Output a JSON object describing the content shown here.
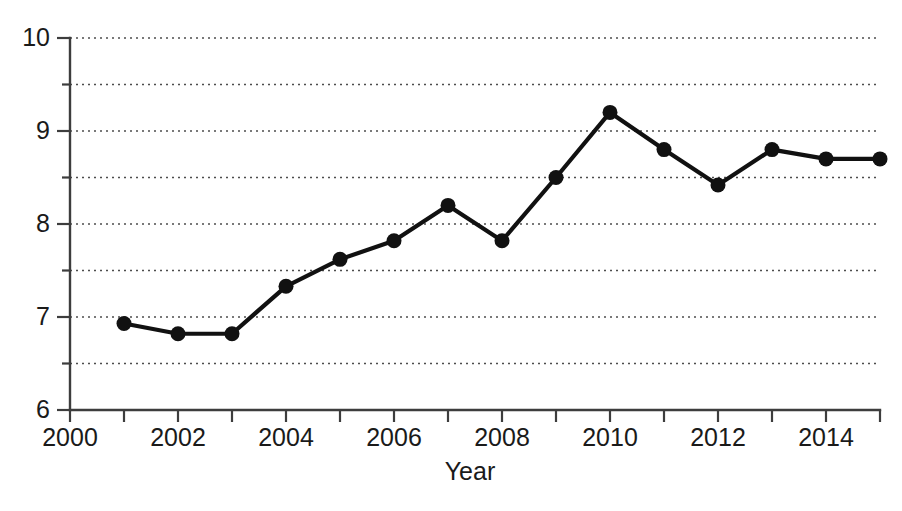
{
  "chart_data": {
    "type": "line",
    "title": "",
    "subtitle": "",
    "xlabel": "Year",
    "ylabel": "",
    "x": [
      2001,
      2002,
      2003,
      2004,
      2005,
      2006,
      2007,
      2008,
      2009,
      2010,
      2011,
      2012,
      2013,
      2014,
      2015
    ],
    "values": [
      6.93,
      6.82,
      6.82,
      7.33,
      7.62,
      7.82,
      8.2,
      7.82,
      8.5,
      9.2,
      8.8,
      8.42,
      8.8,
      8.7,
      8.7
    ],
    "series": [
      {
        "name": "",
        "values": [
          6.93,
          6.82,
          6.82,
          7.33,
          7.62,
          7.82,
          8.2,
          7.82,
          8.5,
          9.2,
          8.8,
          8.42,
          8.8,
          8.7,
          8.7
        ]
      }
    ],
    "xlim": [
      2000,
      2015
    ],
    "ylim": [
      6,
      10
    ],
    "x_tick_values": [
      2000,
      2001,
      2002,
      2003,
      2004,
      2005,
      2006,
      2007,
      2008,
      2009,
      2010,
      2011,
      2012,
      2013,
      2014,
      2015
    ],
    "x_tick_labels": [
      "2000",
      "",
      "2002",
      "",
      "2004",
      "",
      "2006",
      "",
      "2008",
      "",
      "2010",
      "",
      "2012",
      "",
      "2014",
      ""
    ],
    "y_tick_values": [
      6,
      6.5,
      7,
      7.5,
      8,
      8.5,
      9,
      9.5,
      10
    ],
    "y_tick_labels": [
      "6",
      "",
      "7",
      "",
      "8",
      "",
      "9",
      "",
      "10"
    ],
    "grid": true,
    "grid_axis": "y",
    "grid_style": "dotted",
    "legend": "none",
    "legend_position": "none",
    "marker": "circle",
    "line_color": "#111111",
    "marker_color": "#111111",
    "grid_color": "#4d4d4d",
    "axis_color": "#3d3d3d",
    "background_color": "#ffffff",
    "annotations": []
  },
  "axis_titles": {
    "x": "Year"
  }
}
